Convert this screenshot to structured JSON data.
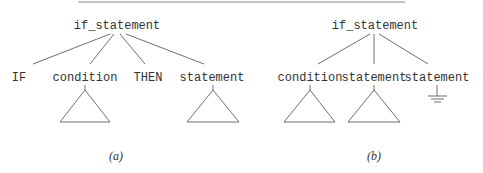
{
  "figure": {
    "rule": {
      "x1": 78,
      "x2": 405,
      "y": 2
    },
    "trees": [
      {
        "id": "a",
        "caption": "(a)",
        "caption_pos": {
          "x": 116,
          "y": 160
        },
        "root": {
          "label": "if_statement",
          "x": 117,
          "y": 25
        },
        "children": [
          {
            "label": "IF",
            "x": 19,
            "y": 77,
            "subtree": "none"
          },
          {
            "label": "condition",
            "x": 85,
            "y": 77,
            "subtree": "triangle"
          },
          {
            "label": "THEN",
            "x": 148,
            "y": 77,
            "subtree": "none"
          },
          {
            "label": "statement",
            "x": 212,
            "y": 77,
            "subtree": "triangle"
          }
        ]
      },
      {
        "id": "b",
        "caption": "(b)",
        "caption_pos": {
          "x": 374,
          "y": 160
        },
        "root": {
          "label": "if_statement",
          "x": 375,
          "y": 25
        },
        "children": [
          {
            "label": "condition",
            "x": 310,
            "y": 77,
            "subtree": "triangle"
          },
          {
            "label": "statement",
            "x": 374,
            "y": 77,
            "subtree": "triangle"
          },
          {
            "label": "statement",
            "x": 437,
            "y": 77,
            "subtree": "ground"
          }
        ]
      }
    ]
  }
}
